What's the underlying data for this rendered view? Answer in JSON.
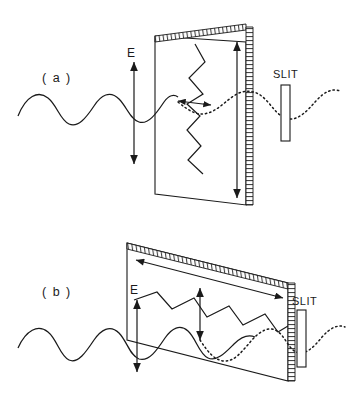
{
  "figure": {
    "type": "physics-diagram",
    "background_color": "#ffffff",
    "ink_color": "#1a1a1a",
    "panels": [
      {
        "id": "a",
        "label": "( a )",
        "field_label": "E",
        "slit_label": "SLIT",
        "description": "vertically polarized incoming wave, vertical zigzag in plane, tall vertical double arrow, short horizontal double arrow, dotted transmitted wave",
        "polarization_axis": "vertical",
        "incoming_wave": "solid-sine",
        "transmitted_wave": "dotted-sine"
      },
      {
        "id": "b",
        "label": "( b )",
        "field_label": "E",
        "slit_label": "SLIT",
        "description": "vertically polarized incoming wave, horizontal zigzag in plane, long horizontal double arrow, short vertical double arrow, dotted transmitted wave",
        "polarization_axis": "horizontal",
        "incoming_wave": "solid-sine",
        "transmitted_wave": "dotted-sine"
      }
    ]
  }
}
